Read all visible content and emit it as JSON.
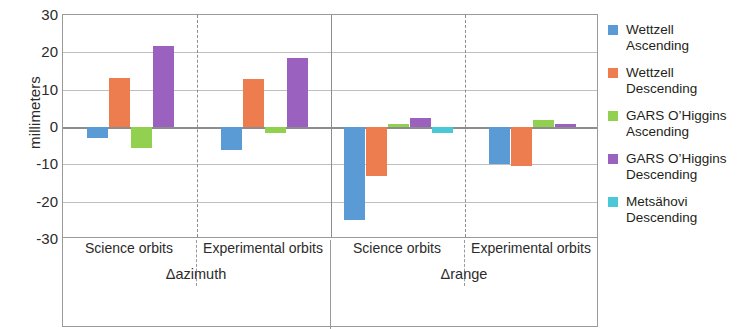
{
  "chart_data": {
    "type": "bar",
    "title": "",
    "subtitle": "",
    "xlabel": "",
    "ylabel": "millimeters",
    "ylim": [
      -30,
      30
    ],
    "yticks": [
      30,
      20,
      10,
      0,
      -10,
      -20,
      -30
    ],
    "ytick_labels": [
      "30",
      "20",
      "10",
      "0",
      "-10",
      "-20",
      "-30"
    ],
    "grid": true,
    "legend_position": "right",
    "panels": [
      {
        "name": "Δazimuth",
        "groups": [
          "Science orbits",
          "Experimental orbits"
        ]
      },
      {
        "name": "Δrange",
        "groups": [
          "Science orbits",
          "Experimental orbits"
        ]
      }
    ],
    "categories": [
      "Δazimuth / Science orbits",
      "Δazimuth / Experimental orbits",
      "Δrange / Science orbits",
      "Δrange / Experimental orbits"
    ],
    "series": [
      {
        "name": "Wettzell Ascending",
        "color": "#5B9BD5",
        "values": [
          -3.0,
          -6.2,
          -25.0,
          -10.0
        ]
      },
      {
        "name": "Wettzell Descending",
        "color": "#ED7D4E",
        "values": [
          13.0,
          12.8,
          -13.0,
          -10.5
        ]
      },
      {
        "name": "GARS O'Higgins Ascending",
        "color": "#92D050",
        "values": [
          -5.5,
          -1.5,
          0.8,
          1.8
        ]
      },
      {
        "name": "GARS O'Higgins Descending",
        "color": "#9B61BE",
        "values": [
          21.8,
          18.5,
          2.5,
          0.9
        ]
      },
      {
        "name": "Metsähovi Descending",
        "color": "#4BC8D8",
        "values": [
          null,
          null,
          -1.5,
          null
        ]
      }
    ]
  },
  "axis": {
    "y_title": "millimeters",
    "y_tick_labels": [
      "30",
      "20",
      "10",
      "0",
      "-10",
      "-20",
      "-30"
    ],
    "group_labels": [
      "Science orbits",
      "Experimental orbits",
      "Science orbits",
      "Experimental orbits"
    ],
    "panel_labels": [
      "Δazimuth",
      "Δrange"
    ]
  },
  "legend": {
    "entries": [
      {
        "line1": "Wettzell",
        "line2": "Ascending",
        "color": "#5B9BD5",
        "swatch_name": "legend-swatch-wettzell-ascending"
      },
      {
        "line1": "Wettzell",
        "line2": "Descending",
        "color": "#ED7D4E",
        "swatch_name": "legend-swatch-wettzell-descending"
      },
      {
        "line1": "GARS O’Higgins",
        "line2": "Ascending",
        "color": "#92D050",
        "swatch_name": "legend-swatch-ohiggins-ascending"
      },
      {
        "line1": "GARS O’Higgins",
        "line2": "Descending",
        "color": "#9B61BE",
        "swatch_name": "legend-swatch-ohiggins-descending"
      },
      {
        "line1": "Metsähovi",
        "line2": "Descending",
        "color": "#4BC8D8",
        "swatch_name": "legend-swatch-metsahovi-descending"
      }
    ]
  }
}
